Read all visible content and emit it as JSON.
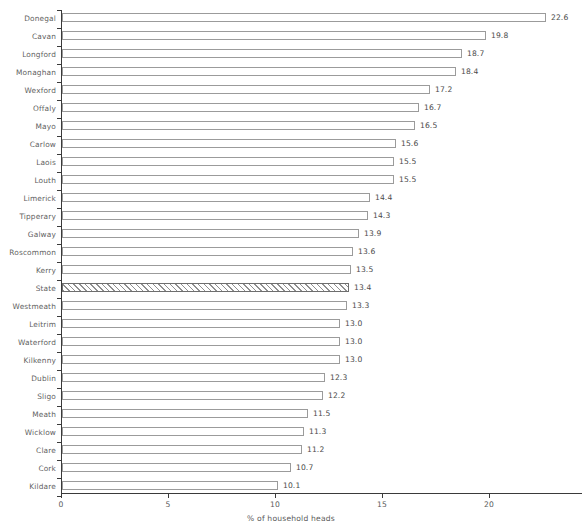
{
  "chart_data": {
    "type": "bar",
    "orientation": "horizontal",
    "title": "",
    "xlabel": "% of household heads",
    "ylabel": "",
    "xlim": [
      0,
      24.3
    ],
    "xticks": [
      0,
      5,
      10,
      15,
      20
    ],
    "xtick_labels": [
      "0",
      "5",
      "10",
      "15",
      "20"
    ],
    "grid": false,
    "legend": null,
    "value_label_format": "one-decimal",
    "categories": [
      "Donegal",
      "Cavan",
      "Longford",
      "Monaghan",
      "Wexford",
      "Offaly",
      "Mayo",
      "Carlow",
      "Laois",
      "Louth",
      "Limerick",
      "Tipperary",
      "Galway",
      "Roscommon",
      "Kerry",
      "State",
      "Westmeath",
      "Leitrim",
      "Waterford",
      "Kilkenny",
      "Dublin",
      "Sligo",
      "Meath",
      "Wicklow",
      "Clare",
      "Cork",
      "Kildare"
    ],
    "values": [
      22.6,
      19.8,
      18.7,
      18.4,
      17.2,
      16.7,
      16.5,
      15.6,
      15.5,
      15.5,
      14.4,
      14.3,
      13.9,
      13.6,
      13.5,
      13.4,
      13.3,
      13.0,
      13.0,
      13.0,
      12.3,
      12.2,
      11.5,
      11.3,
      11.2,
      10.7,
      10.1
    ],
    "value_labels": [
      "22.6",
      "19.8",
      "18.7",
      "18.4",
      "17.2",
      "16.7",
      "16.5",
      "15.6",
      "15.5",
      "15.5",
      "14.4",
      "14.3",
      "13.9",
      "13.6",
      "13.5",
      "13.4",
      "13.3",
      "13.0",
      "13.0",
      "13.0",
      "12.3",
      "12.2",
      "11.5",
      "11.3",
      "11.2",
      "10.7",
      "10.1"
    ],
    "highlighted_category": "State",
    "highlight_style": "diagonal-hatch",
    "bar_fill_color": "#ffffff",
    "bar_border_color": "#9b9b9b",
    "axis_color": "#3a3a3a",
    "text_color": "#5a5a5a"
  }
}
